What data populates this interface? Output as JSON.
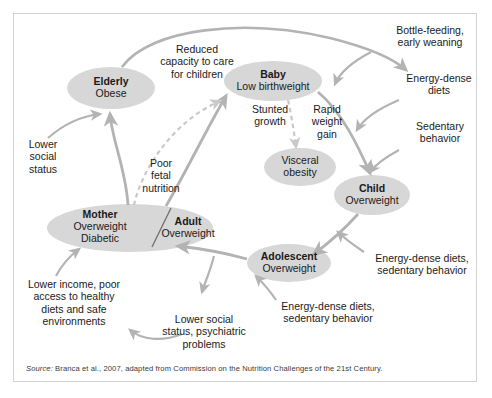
{
  "figure": {
    "type": "cycle-diagram",
    "background_color": "#ffffff",
    "frame_color": "#d2d2d2",
    "node_fill": "#d7d7d7",
    "arrow_color": "#b3b3b3",
    "text_color": "#1a1a1a"
  },
  "nodes": [
    {
      "id": "elderly",
      "title": "Elderly",
      "line2": "Obese",
      "line3": ""
    },
    {
      "id": "baby",
      "title": "Baby",
      "line2": "Low birthweight",
      "line3": ""
    },
    {
      "id": "visceral",
      "title": "",
      "line2": "Visceral",
      "line3": "obesity"
    },
    {
      "id": "child",
      "title": "Child",
      "line2": "Overweight",
      "line3": ""
    },
    {
      "id": "adolescent",
      "title": "Adolescent",
      "line2": "Overweight",
      "line3": ""
    },
    {
      "id": "mother",
      "title": "Mother",
      "line2": "Overweight",
      "line3": "Diabetic"
    },
    {
      "id": "adult",
      "title": "Adult",
      "line2": "Overweight",
      "line3": ""
    }
  ],
  "annotations": [
    {
      "id": "reduced-capacity",
      "line1": "Reduced",
      "line2": "capacity to care",
      "line3": "for children"
    },
    {
      "id": "bottle-feeding",
      "line1": "Bottle-feeding,",
      "line2": "early weaning",
      "line3": ""
    },
    {
      "id": "energy-dense-diets",
      "line1": "Energy-dense",
      "line2": "diets",
      "line3": ""
    },
    {
      "id": "sedentary-behavior",
      "line1": "Sedentary",
      "line2": "behavior",
      "line3": ""
    },
    {
      "id": "lower-social-status",
      "line1": "Lower",
      "line2": "social",
      "line3": "status"
    },
    {
      "id": "poor-fetal-nutrition",
      "line1": "Poor",
      "line2": "fetal",
      "line3": "nutrition"
    },
    {
      "id": "stunted-growth",
      "line1": "Stunted",
      "line2": "growth",
      "line3": ""
    },
    {
      "id": "rapid-weight-gain",
      "line1": "Rapid",
      "line2": "weight",
      "line3": "gain"
    },
    {
      "id": "lower-income",
      "line1": "Lower income, poor",
      "line2": "access to healthy",
      "line3": "diets and safe",
      "line4": "environments"
    },
    {
      "id": "lower-social-psych",
      "line1": "Lower social",
      "line2": "status, psychiatric",
      "line3": "problems"
    },
    {
      "id": "edd-sb-adolescent",
      "line1": "Energy-dense diets,",
      "line2": "sedentary behavior",
      "line3": ""
    },
    {
      "id": "edd-sb-child",
      "line1": "Energy-dense diets,",
      "line2": "sedentary behavior",
      "line3": ""
    }
  ],
  "source": {
    "label": "Source:",
    "text": " Branca et al., 2007, adapted from Commission on the Nutrition Challenges of the 21st Century."
  }
}
